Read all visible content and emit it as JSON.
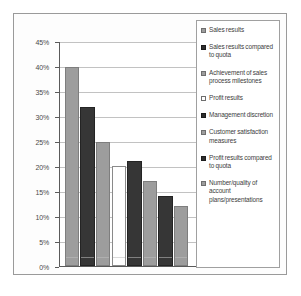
{
  "chart_data": {
    "type": "bar",
    "title": "",
    "subtitle": "",
    "xlabel": "",
    "ylabel": "",
    "ylim": [
      0,
      45
    ],
    "ytick_labels": [
      "0%",
      "5%",
      "10%",
      "15%",
      "20%",
      "25%",
      "30%",
      "35%",
      "40%",
      "45%"
    ],
    "ytick_values": [
      0,
      5,
      10,
      15,
      20,
      25,
      30,
      35,
      40,
      45
    ],
    "grid": true,
    "legend_position": "right",
    "categories": [
      "Sales results",
      "Sales results compared to quota",
      "Achievement of sales process milestones",
      "Profit results",
      "Management discretion",
      "Customer satisfaction measures",
      "Profit results compared to quota",
      "Number/quality of account plans/presentations"
    ],
    "values": [
      40,
      32,
      25,
      20,
      21,
      17,
      14,
      12
    ],
    "value_labels": [
      "40%",
      "32%",
      "25%",
      "20%",
      "21%",
      "17%",
      "14%",
      "12%"
    ],
    "bar_styles": [
      "light",
      "dark",
      "light",
      "white",
      "dark",
      "light",
      "dark",
      "light"
    ],
    "colors": {
      "light_gray": "#9d9d9d",
      "dark_gray": "#363636",
      "white": "#ffffff",
      "gridline": "#c2c2c2",
      "axis": "#5a5a5a",
      "text": "#3d3d3d"
    }
  },
  "legend": {
    "items": [
      {
        "label": "Sales results",
        "swatch": "light"
      },
      {
        "label": "Sales results compared to quota",
        "swatch": "dark"
      },
      {
        "label": "Achievement of sales process milestones",
        "swatch": "light"
      },
      {
        "label": "Profit results",
        "swatch": "white"
      },
      {
        "label": "Management discretion",
        "swatch": "dark"
      },
      {
        "label": "Customer satisfaction measures",
        "swatch": "light"
      },
      {
        "label": "Profit results compared to quota",
        "swatch": "dark"
      },
      {
        "label": "Number/quality of account plans/presentations",
        "swatch": "light"
      }
    ]
  }
}
